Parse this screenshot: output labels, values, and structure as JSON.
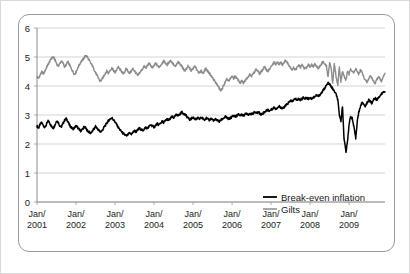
{
  "chart_data": {
    "type": "line",
    "title": "",
    "subtitle": "",
    "xlabel": "",
    "ylabel": "",
    "ylim": [
      0,
      6
    ],
    "yticks": [
      0,
      1,
      2,
      3,
      4,
      5,
      6
    ],
    "ytick_labels": [
      "0",
      "1",
      "2",
      "3",
      "4",
      "5",
      "6"
    ],
    "grid": true,
    "grid_axis": "y",
    "legend_position": "bottom-right",
    "xlim": [
      2001.0,
      2009.92
    ],
    "xticks": [
      2001,
      2002,
      2003,
      2004,
      2005,
      2006,
      2007,
      2008,
      2009
    ],
    "xtick_labels": [
      {
        "line1": "Jan/",
        "line2": "2001"
      },
      {
        "line1": "Jan/",
        "line2": "2002"
      },
      {
        "line1": "Jan/",
        "line2": "2003"
      },
      {
        "line1": "Jan/",
        "line2": "2004"
      },
      {
        "line1": "Jan/",
        "line2": "2005"
      },
      {
        "line1": "Jan/",
        "line2": "2006"
      },
      {
        "line1": "Jan/",
        "line2": "2007"
      },
      {
        "line1": "Jan/",
        "line2": "2008"
      },
      {
        "line1": "Jan/",
        "line2": "2009"
      }
    ],
    "series": [
      {
        "name": "Break-even inflation",
        "color": "#000000",
        "width": 1.5,
        "x": [
          2001.0,
          2001.04,
          2001.08,
          2001.12,
          2001.17,
          2001.21,
          2001.25,
          2001.29,
          2001.33,
          2001.37,
          2001.42,
          2001.46,
          2001.5,
          2001.54,
          2001.58,
          2001.62,
          2001.67,
          2001.71,
          2001.75,
          2001.79,
          2001.83,
          2001.87,
          2001.92,
          2001.96,
          2002.0,
          2002.04,
          2002.08,
          2002.12,
          2002.17,
          2002.21,
          2002.25,
          2002.29,
          2002.33,
          2002.37,
          2002.42,
          2002.46,
          2002.5,
          2002.54,
          2002.58,
          2002.62,
          2002.67,
          2002.71,
          2002.75,
          2002.79,
          2002.83,
          2002.87,
          2002.92,
          2002.96,
          2003.0,
          2003.04,
          2003.08,
          2003.12,
          2003.17,
          2003.21,
          2003.25,
          2003.29,
          2003.33,
          2003.37,
          2003.42,
          2003.46,
          2003.5,
          2003.54,
          2003.58,
          2003.62,
          2003.67,
          2003.71,
          2003.75,
          2003.79,
          2003.83,
          2003.87,
          2003.92,
          2003.96,
          2004.0,
          2004.04,
          2004.08,
          2004.12,
          2004.17,
          2004.21,
          2004.25,
          2004.29,
          2004.33,
          2004.37,
          2004.42,
          2004.46,
          2004.5,
          2004.54,
          2004.58,
          2004.62,
          2004.67,
          2004.71,
          2004.75,
          2004.79,
          2004.83,
          2004.87,
          2004.92,
          2004.96,
          2005.0,
          2005.04,
          2005.08,
          2005.12,
          2005.17,
          2005.21,
          2005.25,
          2005.29,
          2005.33,
          2005.37,
          2005.42,
          2005.46,
          2005.5,
          2005.54,
          2005.58,
          2005.62,
          2005.67,
          2005.71,
          2005.75,
          2005.79,
          2005.83,
          2005.87,
          2005.92,
          2005.96,
          2006.0,
          2006.04,
          2006.08,
          2006.12,
          2006.17,
          2006.21,
          2006.25,
          2006.29,
          2006.33,
          2006.37,
          2006.42,
          2006.46,
          2006.5,
          2006.54,
          2006.58,
          2006.62,
          2006.67,
          2006.71,
          2006.75,
          2006.79,
          2006.83,
          2006.87,
          2006.92,
          2006.96,
          2007.0,
          2007.04,
          2007.08,
          2007.12,
          2007.17,
          2007.21,
          2007.25,
          2007.29,
          2007.33,
          2007.37,
          2007.42,
          2007.46,
          2007.5,
          2007.54,
          2007.58,
          2007.62,
          2007.67,
          2007.71,
          2007.75,
          2007.79,
          2007.83,
          2007.87,
          2007.92,
          2007.96,
          2008.0,
          2008.04,
          2008.08,
          2008.12,
          2008.17,
          2008.21,
          2008.25,
          2008.29,
          2008.33,
          2008.37,
          2008.42,
          2008.46,
          2008.5,
          2008.54,
          2008.58,
          2008.62,
          2008.67,
          2008.71,
          2008.75,
          2008.79,
          2008.83,
          2008.87,
          2008.92,
          2008.96,
          2009.0,
          2009.04,
          2009.08,
          2009.12,
          2009.17,
          2009.21,
          2009.25,
          2009.29,
          2009.33,
          2009.37,
          2009.42,
          2009.46,
          2009.5,
          2009.54,
          2009.58,
          2009.62,
          2009.67,
          2009.71,
          2009.75,
          2009.79,
          2009.83,
          2009.87,
          2009.92
        ],
        "y": [
          2.62,
          2.55,
          2.68,
          2.74,
          2.62,
          2.58,
          2.7,
          2.8,
          2.72,
          2.6,
          2.55,
          2.66,
          2.8,
          2.76,
          2.64,
          2.58,
          2.72,
          2.82,
          2.88,
          2.78,
          2.66,
          2.58,
          2.52,
          2.56,
          2.62,
          2.58,
          2.5,
          2.45,
          2.52,
          2.6,
          2.54,
          2.46,
          2.42,
          2.38,
          2.44,
          2.52,
          2.6,
          2.54,
          2.48,
          2.42,
          2.46,
          2.56,
          2.64,
          2.72,
          2.8,
          2.86,
          2.9,
          2.84,
          2.76,
          2.68,
          2.58,
          2.5,
          2.42,
          2.36,
          2.32,
          2.28,
          2.32,
          2.38,
          2.34,
          2.4,
          2.46,
          2.42,
          2.48,
          2.54,
          2.5,
          2.46,
          2.52,
          2.58,
          2.54,
          2.6,
          2.66,
          2.62,
          2.58,
          2.64,
          2.7,
          2.66,
          2.72,
          2.78,
          2.74,
          2.8,
          2.86,
          2.82,
          2.88,
          2.94,
          2.9,
          2.96,
          3.02,
          2.98,
          3.04,
          3.1,
          3.06,
          3.02,
          2.96,
          2.9,
          2.84,
          2.88,
          2.92,
          2.88,
          2.84,
          2.9,
          2.86,
          2.92,
          2.88,
          2.84,
          2.9,
          2.86,
          2.82,
          2.88,
          2.84,
          2.8,
          2.86,
          2.82,
          2.78,
          2.82,
          2.86,
          2.9,
          2.94,
          2.9,
          2.86,
          2.9,
          2.94,
          2.98,
          2.94,
          2.98,
          3.02,
          2.98,
          3.02,
          2.98,
          3.02,
          3.06,
          3.02,
          3.06,
          3.02,
          3.06,
          3.1,
          3.06,
          3.1,
          3.06,
          3.02,
          3.06,
          3.1,
          3.14,
          3.18,
          3.14,
          3.18,
          3.22,
          3.26,
          3.22,
          3.26,
          3.3,
          3.26,
          3.22,
          3.26,
          3.32,
          3.38,
          3.44,
          3.5,
          3.46,
          3.52,
          3.56,
          3.52,
          3.56,
          3.52,
          3.56,
          3.6,
          3.56,
          3.6,
          3.56,
          3.6,
          3.56,
          3.6,
          3.64,
          3.68,
          3.64,
          3.7,
          3.76,
          3.84,
          3.92,
          4.02,
          4.1,
          4.06,
          3.98,
          3.9,
          3.82,
          3.7,
          3.52,
          3.0,
          2.8,
          3.3,
          2.2,
          1.72,
          2.1,
          2.7,
          2.95,
          2.88,
          2.6,
          2.2,
          2.8,
          3.1,
          3.3,
          3.42,
          3.38,
          3.3,
          3.42,
          3.52,
          3.48,
          3.4,
          3.52,
          3.58,
          3.52,
          3.6,
          3.66,
          3.72,
          3.78,
          3.8
        ]
      },
      {
        "name": "Gilts",
        "color": "#8c8c8c",
        "width": 1.4,
        "x": [
          2001.0,
          2001.04,
          2001.08,
          2001.12,
          2001.17,
          2001.21,
          2001.25,
          2001.29,
          2001.33,
          2001.37,
          2001.42,
          2001.46,
          2001.5,
          2001.54,
          2001.58,
          2001.62,
          2001.67,
          2001.71,
          2001.75,
          2001.79,
          2001.83,
          2001.87,
          2001.92,
          2001.96,
          2002.0,
          2002.04,
          2002.08,
          2002.12,
          2002.17,
          2002.21,
          2002.25,
          2002.29,
          2002.33,
          2002.37,
          2002.42,
          2002.46,
          2002.5,
          2002.54,
          2002.58,
          2002.62,
          2002.67,
          2002.71,
          2002.75,
          2002.79,
          2002.83,
          2002.87,
          2002.92,
          2002.96,
          2003.0,
          2003.04,
          2003.08,
          2003.12,
          2003.17,
          2003.21,
          2003.25,
          2003.29,
          2003.33,
          2003.37,
          2003.42,
          2003.46,
          2003.5,
          2003.54,
          2003.58,
          2003.62,
          2003.67,
          2003.71,
          2003.75,
          2003.79,
          2003.83,
          2003.87,
          2003.92,
          2003.96,
          2004.0,
          2004.04,
          2004.08,
          2004.12,
          2004.17,
          2004.21,
          2004.25,
          2004.29,
          2004.33,
          2004.37,
          2004.42,
          2004.46,
          2004.5,
          2004.54,
          2004.58,
          2004.62,
          2004.67,
          2004.71,
          2004.75,
          2004.79,
          2004.83,
          2004.87,
          2004.92,
          2004.96,
          2005.0,
          2005.04,
          2005.08,
          2005.12,
          2005.17,
          2005.21,
          2005.25,
          2005.29,
          2005.33,
          2005.37,
          2005.42,
          2005.46,
          2005.5,
          2005.54,
          2005.58,
          2005.62,
          2005.67,
          2005.71,
          2005.75,
          2005.79,
          2005.83,
          2005.87,
          2005.92,
          2005.96,
          2006.0,
          2006.04,
          2006.08,
          2006.12,
          2006.17,
          2006.21,
          2006.25,
          2006.29,
          2006.33,
          2006.37,
          2006.42,
          2006.46,
          2006.5,
          2006.54,
          2006.58,
          2006.62,
          2006.67,
          2006.71,
          2006.75,
          2006.79,
          2006.83,
          2006.87,
          2006.92,
          2006.96,
          2007.0,
          2007.04,
          2007.08,
          2007.12,
          2007.17,
          2007.21,
          2007.25,
          2007.29,
          2007.33,
          2007.37,
          2007.42,
          2007.46,
          2007.5,
          2007.54,
          2007.58,
          2007.62,
          2007.67,
          2007.71,
          2007.75,
          2007.79,
          2007.83,
          2007.87,
          2007.92,
          2007.96,
          2008.0,
          2008.04,
          2008.08,
          2008.12,
          2008.17,
          2008.21,
          2008.25,
          2008.29,
          2008.33,
          2008.37,
          2008.42,
          2008.46,
          2008.5,
          2008.54,
          2008.58,
          2008.62,
          2008.67,
          2008.71,
          2008.75,
          2008.79,
          2008.83,
          2008.87,
          2008.92,
          2008.96,
          2009.0,
          2009.04,
          2009.08,
          2009.12,
          2009.17,
          2009.21,
          2009.25,
          2009.29,
          2009.33,
          2009.37,
          2009.42,
          2009.46,
          2009.5,
          2009.54,
          2009.58,
          2009.62,
          2009.67,
          2009.71,
          2009.75,
          2009.79,
          2009.83,
          2009.87,
          2009.92
        ],
        "y": [
          4.32,
          4.26,
          4.38,
          4.48,
          4.42,
          4.54,
          4.66,
          4.76,
          4.86,
          4.96,
          5.0,
          4.9,
          4.78,
          4.68,
          4.76,
          4.86,
          4.78,
          4.66,
          4.74,
          4.84,
          4.74,
          4.62,
          4.5,
          4.4,
          4.48,
          4.6,
          4.72,
          4.82,
          4.9,
          4.98,
          5.06,
          5.0,
          4.9,
          4.8,
          4.7,
          4.58,
          4.46,
          4.36,
          4.26,
          4.16,
          4.24,
          4.34,
          4.44,
          4.52,
          4.44,
          4.54,
          4.62,
          4.54,
          4.46,
          4.56,
          4.66,
          4.58,
          4.5,
          4.42,
          4.5,
          4.6,
          4.52,
          4.44,
          4.52,
          4.6,
          4.52,
          4.44,
          4.36,
          4.44,
          4.52,
          4.6,
          4.68,
          4.62,
          4.7,
          4.78,
          4.7,
          4.62,
          4.7,
          4.78,
          4.72,
          4.64,
          4.72,
          4.8,
          4.86,
          4.8,
          4.72,
          4.8,
          4.88,
          4.82,
          4.74,
          4.66,
          4.74,
          4.82,
          4.76,
          4.68,
          4.6,
          4.52,
          4.6,
          4.68,
          4.6,
          4.52,
          4.6,
          4.68,
          4.6,
          4.52,
          4.44,
          4.52,
          4.44,
          4.52,
          4.6,
          4.52,
          4.44,
          4.36,
          4.28,
          4.2,
          4.12,
          4.04,
          3.92,
          3.84,
          3.92,
          4.04,
          4.14,
          4.24,
          4.16,
          4.26,
          4.34,
          4.26,
          4.34,
          4.26,
          4.18,
          4.1,
          4.18,
          4.1,
          4.18,
          4.26,
          4.34,
          4.42,
          4.34,
          4.42,
          4.5,
          4.58,
          4.5,
          4.42,
          4.5,
          4.58,
          4.66,
          4.58,
          4.5,
          4.58,
          4.66,
          4.74,
          4.82,
          4.74,
          4.82,
          4.74,
          4.82,
          4.74,
          4.82,
          4.88,
          4.8,
          4.72,
          4.64,
          4.56,
          4.64,
          4.56,
          4.64,
          4.72,
          4.64,
          4.72,
          4.66,
          4.58,
          4.66,
          4.74,
          4.66,
          4.74,
          4.68,
          4.76,
          4.68,
          4.6,
          4.68,
          4.76,
          4.84,
          4.76,
          4.68,
          4.3,
          4.82,
          4.6,
          4.1,
          4.76,
          4.3,
          4.02,
          4.66,
          4.16,
          4.5,
          4.34,
          4.2,
          4.52,
          4.4,
          4.6,
          4.52,
          4.44,
          4.62,
          4.48,
          4.4,
          4.56,
          4.48,
          4.32,
          4.2,
          4.12,
          4.24,
          4.36,
          4.28,
          4.18,
          4.1,
          4.22,
          4.34,
          4.26,
          4.16,
          4.3,
          4.44
        ]
      }
    ],
    "legend": [
      {
        "label": "Break-even inflation",
        "color": "#000000"
      },
      {
        "label": "Gilts",
        "color": "#8c8c8c"
      }
    ]
  }
}
